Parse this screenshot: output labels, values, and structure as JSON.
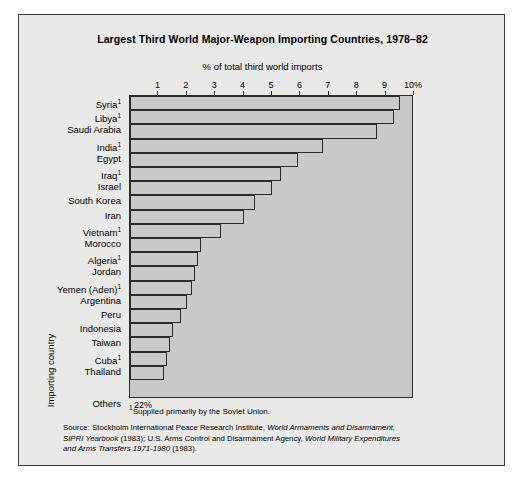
{
  "figure": {
    "title": "Largest Third World Major-Weapon Importing Countries, 1978–82",
    "subtitle": "% of total third world imports",
    "ylabel": "Importing country",
    "footnote_marker": "1",
    "footnote_text": "Supplied primarily by the Soviet Union.",
    "source_line1_plain_a": "Source: Stockholm International Peace Research Institute, ",
    "source_line1_italic": "World Armaments and Disarmament,",
    "source_line2_italic_a": "SIPRI Yearbook",
    "source_line2_plain_a": " (1983); U.S. Arms Control and Disarmament Agency, ",
    "source_line2_italic_b": "World Military Expenditures",
    "source_line3_italic": "and Arms Transfers 1971-1980",
    "source_line3_plain": " (1983)."
  },
  "colors": {
    "page_background": "#ffffff",
    "figure_background": "#e9e9e7",
    "plot_background": "#c9c9c7",
    "bar_fill": "#c9c9c7",
    "bar_outline": "#2b2b2b",
    "text": "#000000",
    "frame": "#3a3a3a"
  },
  "chart_data": {
    "type": "bar",
    "orientation": "horizontal",
    "title": "Largest Third World Major-Weapon Importing Countries, 1978–82",
    "subtitle": "% of total third world imports",
    "xlabel": "% of total third world imports",
    "ylabel": "Importing country",
    "xlim": [
      0,
      10
    ],
    "grid": false,
    "legend": null,
    "tick_values": [
      1,
      2,
      3,
      4,
      5,
      6,
      7,
      8,
      9,
      10
    ],
    "tick_labels": [
      "1",
      "2",
      "3",
      "4",
      "5",
      "6",
      "7",
      "8",
      "9",
      "10%"
    ],
    "categories": [
      "Syria",
      "Libya",
      "Saudi Arabia",
      "India",
      "Egypt",
      "Iraq",
      "Israel",
      "South Korea",
      "Iran",
      "Vietnam",
      "Morocco",
      "Algeria",
      "Jordan",
      "Yemen (Aden)",
      "Argentina",
      "Peru",
      "Indonesia",
      "Taiwan",
      "Cuba",
      "Thailand",
      "Others"
    ],
    "values": [
      9.5,
      9.3,
      8.7,
      6.8,
      5.9,
      5.3,
      5.0,
      4.4,
      4.0,
      3.2,
      2.5,
      2.4,
      2.3,
      2.2,
      2.0,
      1.8,
      1.5,
      1.4,
      1.3,
      1.2,
      22
    ],
    "soviet_supplied_footnote": [
      "Syria",
      "Libya",
      "India",
      "Iraq",
      "Vietnam",
      "Algeria",
      "Yemen (Aden)",
      "Cuba"
    ],
    "annotations": [
      {
        "category": "Others",
        "text": "22%",
        "note": "value exceeds axis range; shown as inline text with no drawn bar"
      }
    ]
  },
  "rows": [
    {
      "label": "Syria",
      "footnote": true,
      "value": 9.5,
      "inline_label": null
    },
    {
      "label": "Libya",
      "footnote": true,
      "value": 9.3,
      "inline_label": null
    },
    {
      "label": "Saudi Arabia",
      "footnote": false,
      "value": 8.7,
      "inline_label": null
    },
    {
      "label": "India",
      "footnote": true,
      "value": 6.8,
      "inline_label": null
    },
    {
      "label": "Egypt",
      "footnote": false,
      "value": 5.9,
      "inline_label": null
    },
    {
      "label": "Iraq",
      "footnote": true,
      "value": 5.3,
      "inline_label": null
    },
    {
      "label": "Israel",
      "footnote": false,
      "value": 5.0,
      "inline_label": null
    },
    {
      "label": "South Korea",
      "footnote": false,
      "value": 4.4,
      "inline_label": null
    },
    {
      "label": "Iran",
      "footnote": false,
      "value": 4.0,
      "inline_label": null
    },
    {
      "label": "Vietnam",
      "footnote": true,
      "value": 3.2,
      "inline_label": null
    },
    {
      "label": "Morocco",
      "footnote": false,
      "value": 2.5,
      "inline_label": null
    },
    {
      "label": "Algeria",
      "footnote": true,
      "value": 2.4,
      "inline_label": null
    },
    {
      "label": "Jordan",
      "footnote": false,
      "value": 2.3,
      "inline_label": null
    },
    {
      "label": "Yemen (Aden)",
      "footnote": true,
      "value": 2.2,
      "inline_label": null
    },
    {
      "label": "Argentina",
      "footnote": false,
      "value": 2.0,
      "inline_label": null
    },
    {
      "label": "Peru",
      "footnote": false,
      "value": 1.8,
      "inline_label": null
    },
    {
      "label": "Indonesia",
      "footnote": false,
      "value": 1.5,
      "inline_label": null
    },
    {
      "label": "Taiwan",
      "footnote": false,
      "value": 1.4,
      "inline_label": null
    },
    {
      "label": "Cuba",
      "footnote": true,
      "value": 1.3,
      "inline_label": null
    },
    {
      "label": "Thailand",
      "footnote": false,
      "value": 1.2,
      "inline_label": null
    },
    {
      "label": "Others",
      "footnote": false,
      "value": 22,
      "inline_label": "22%"
    }
  ]
}
